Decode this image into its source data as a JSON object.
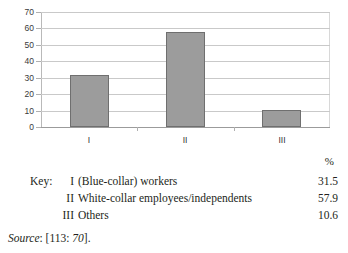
{
  "chart_data": {
    "type": "bar",
    "title": "",
    "xlabel": "",
    "ylabel": "",
    "categories": [
      "I",
      "II",
      "III"
    ],
    "values": [
      31.5,
      57.9,
      10.6
    ],
    "ylim": [
      0,
      70
    ],
    "yticks": [
      0,
      10,
      20,
      30,
      40,
      50,
      60,
      70
    ],
    "ytick_labels": [
      "0",
      "10",
      "20",
      "30",
      "40",
      "50",
      "60",
      "70"
    ],
    "grid": true,
    "legend_position": "below",
    "bar_color": "#9c9c9c",
    "bar_border_color": "#6f6f6f",
    "gridline_color": "#c9c9c9"
  },
  "legend": {
    "percent_header": "%",
    "key_label": "Key:",
    "rows": [
      {
        "numeral": "I",
        "text": "(Blue-collar) workers",
        "value": "31.5"
      },
      {
        "numeral": "II",
        "text": "White-collar employees/independents",
        "value": "57.9"
      },
      {
        "numeral": "III",
        "text": "Others",
        "value": "10.6"
      }
    ]
  },
  "source": {
    "label": "Source",
    "separator": ": [",
    "ref": "113",
    "mid": ": ",
    "page": "70",
    "end": "]."
  }
}
